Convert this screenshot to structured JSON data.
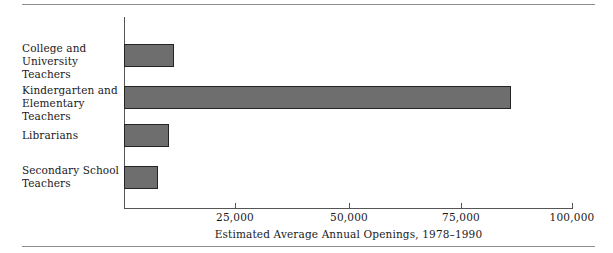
{
  "chart_data": {
    "type": "bar",
    "orientation": "horizontal",
    "title": "",
    "xlabel": "Estimated Average Annual Openings, 1978–1990",
    "ylabel": "",
    "xlim": [
      0,
      101000
    ],
    "grid": false,
    "legend": null,
    "categories": [
      "College and University Teachers",
      "Kindergarten and Elementary Teachers",
      "Librarians",
      "Secondary School Teachers"
    ],
    "values": [
      11300,
      87000,
      10100,
      7700
    ],
    "xticks": [
      25000,
      50000,
      75000,
      100000
    ],
    "xtick_labels": [
      "25,000",
      "50,000",
      "75,000",
      "100,000"
    ],
    "series": [
      {
        "name": "Estimated Average Annual Openings",
        "values": [
          11300,
          87000,
          10100,
          7700
        ]
      }
    ]
  },
  "bars": [
    {
      "label_line1": "College and",
      "label_line2": "University Teachers",
      "value": 11300
    },
    {
      "label_line1": "Kindergarten and",
      "label_line2": "Elementary Teachers",
      "value": 87000
    },
    {
      "label_line1": "Librarians",
      "label_line2": "",
      "value": 10100
    },
    {
      "label_line1": "Secondary School",
      "label_line2": "Teachers",
      "value": 7700
    }
  ],
  "axis": {
    "title": "Estimated Average Annual Openings, 1978–1990",
    "tick_labels": [
      "25,000",
      "50,000",
      "75,000",
      "100,000"
    ]
  },
  "colors": {
    "bar_fill": "#6e6e6e",
    "bar_border": "#242424",
    "axis_line": "#555555",
    "rule": "#8d8d8d",
    "text": "#1a1a1a",
    "background": "#ffffff"
  }
}
